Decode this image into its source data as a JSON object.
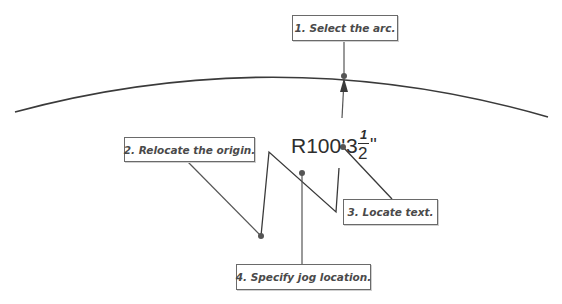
{
  "diagram": {
    "colors": {
      "line": "#3a3a3a",
      "box_border": "#6a6a6a",
      "box_text": "#4a4a4a",
      "dim_text": "#2e2e2e",
      "background": "#ffffff"
    },
    "dimension_text": {
      "prefix": "R100'",
      "whole": "3",
      "numerator": "1",
      "denominator": "2",
      "suffix": "\""
    },
    "callouts": [
      {
        "id": 1,
        "label": "1. Select the arc."
      },
      {
        "id": 2,
        "label": "2. Relocate the origin."
      },
      {
        "id": 3,
        "label": "3. Locate text."
      },
      {
        "id": 4,
        "label": "4. Specify jog location."
      }
    ]
  }
}
